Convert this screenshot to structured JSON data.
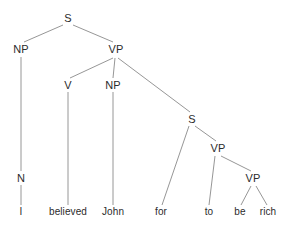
{
  "figure": {
    "type": "syntax-tree",
    "sentence": "I believed John for to be rich",
    "width": 289,
    "height": 228,
    "background_color": "#ffffff",
    "text_color": "#2b2b2b",
    "line_color": "#8a8a8a"
  },
  "nodes": [
    {
      "id": "s_root",
      "label": "S",
      "x": 68,
      "y": 18,
      "kind": "nonterminal"
    },
    {
      "id": "np_subj",
      "label": "NP",
      "x": 21,
      "y": 49,
      "kind": "nonterminal"
    },
    {
      "id": "vp_main",
      "label": "VP",
      "x": 116,
      "y": 49,
      "kind": "nonterminal"
    },
    {
      "id": "v_main",
      "label": "V",
      "x": 68,
      "y": 85,
      "kind": "nonterminal"
    },
    {
      "id": "np_obj",
      "label": "NP",
      "x": 113,
      "y": 85,
      "kind": "nonterminal"
    },
    {
      "id": "s_embed",
      "label": "S",
      "x": 192,
      "y": 119,
      "kind": "nonterminal"
    },
    {
      "id": "vp_embed",
      "label": "VP",
      "x": 218,
      "y": 148,
      "kind": "nonterminal"
    },
    {
      "id": "vp_inner",
      "label": "VP",
      "x": 253,
      "y": 178,
      "kind": "nonterminal"
    },
    {
      "id": "n_subj",
      "label": "N",
      "x": 21,
      "y": 178,
      "kind": "nonterminal"
    }
  ],
  "leaves": [
    {
      "id": "leaf_i",
      "label": "I",
      "x": 21,
      "y": 212
    },
    {
      "id": "leaf_believed",
      "label": "believed",
      "x": 68,
      "y": 212
    },
    {
      "id": "leaf_john",
      "label": "John",
      "x": 113,
      "y": 212
    },
    {
      "id": "leaf_for",
      "label": "for",
      "x": 161,
      "y": 212
    },
    {
      "id": "leaf_to",
      "label": "to",
      "x": 209,
      "y": 212
    },
    {
      "id": "leaf_be",
      "label": "be",
      "x": 240,
      "y": 212
    },
    {
      "id": "leaf_rich",
      "label": "rich",
      "x": 268,
      "y": 212
    }
  ],
  "edges": [
    {
      "id": "edge_s_np",
      "from": "s_root",
      "to": "np_subj",
      "x1": 63,
      "y1": 25,
      "x2": 24,
      "y2": 42
    },
    {
      "id": "edge_s_vp",
      "from": "s_root",
      "to": "vp_main",
      "x1": 73,
      "y1": 25,
      "x2": 113,
      "y2": 42
    },
    {
      "id": "edge_np_n",
      "from": "np_subj",
      "to": "n_subj",
      "x1": 21,
      "y1": 57,
      "x2": 21,
      "y2": 171
    },
    {
      "id": "edge_n_i",
      "from": "n_subj",
      "to": "leaf_i",
      "x1": 21,
      "y1": 185,
      "x2": 21,
      "y2": 205
    },
    {
      "id": "edge_vp_v",
      "from": "vp_main",
      "to": "v_main",
      "x1": 113,
      "y1": 58,
      "x2": 70,
      "y2": 78
    },
    {
      "id": "edge_vp_np",
      "from": "vp_main",
      "to": "np_obj",
      "x1": 115,
      "y1": 58,
      "x2": 113,
      "y2": 78
    },
    {
      "id": "edge_vp_s",
      "from": "vp_main",
      "to": "s_embed",
      "x1": 118,
      "y1": 58,
      "x2": 190,
      "y2": 112
    },
    {
      "id": "edge_v_believed",
      "from": "v_main",
      "to": "leaf_believed",
      "x1": 68,
      "y1": 92,
      "x2": 68,
      "y2": 205
    },
    {
      "id": "edge_np_john",
      "from": "np_obj",
      "to": "leaf_john",
      "x1": 113,
      "y1": 92,
      "x2": 113,
      "y2": 205
    },
    {
      "id": "edge_s_for",
      "from": "s_embed",
      "to": "leaf_for",
      "x1": 189,
      "y1": 126,
      "x2": 162,
      "y2": 205
    },
    {
      "id": "edge_s_vpembed",
      "from": "s_embed",
      "to": "vp_embed",
      "x1": 195,
      "y1": 126,
      "x2": 216,
      "y2": 141
    },
    {
      "id": "edge_vpembed_to",
      "from": "vp_embed",
      "to": "leaf_to",
      "x1": 215,
      "y1": 156,
      "x2": 209,
      "y2": 205
    },
    {
      "id": "edge_vpembed_vp",
      "from": "vp_embed",
      "to": "vp_inner",
      "x1": 221,
      "y1": 156,
      "x2": 251,
      "y2": 171
    },
    {
      "id": "edge_vpinner_be",
      "from": "vp_inner",
      "to": "leaf_be",
      "x1": 251,
      "y1": 186,
      "x2": 241,
      "y2": 205
    },
    {
      "id": "edge_vpinner_rich",
      "from": "vp_inner",
      "to": "leaf_rich",
      "x1": 256,
      "y1": 186,
      "x2": 267,
      "y2": 205
    }
  ]
}
